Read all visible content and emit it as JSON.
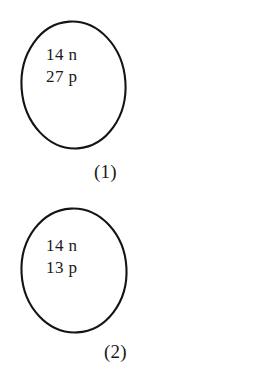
{
  "diagram": {
    "title": "",
    "background_color": "#ffffff",
    "stroke_color": "#141414",
    "text_color": "#1a1a1a",
    "items": [
      {
        "id": "nucleus-1",
        "label": "(1)",
        "lines": [
          "14 n",
          "27 p"
        ],
        "neutrons": "14 n",
        "protons": "27 p"
      },
      {
        "id": "nucleus-2",
        "label": "(2)",
        "lines": [
          "14 n",
          "13 p"
        ],
        "neutrons": "14 n",
        "protons": "13 p"
      }
    ]
  }
}
